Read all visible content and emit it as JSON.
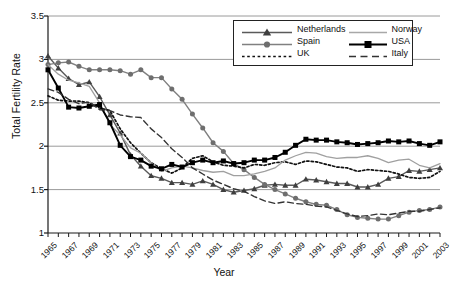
{
  "chart_data": {
    "type": "line",
    "title": "",
    "xlabel": "Year",
    "ylabel": "Total Fertility Rate",
    "ylim": [
      1,
      3.5
    ],
    "yticks": [
      "1",
      "1.5",
      "2",
      "2.5",
      "3",
      "3.5"
    ],
    "ytick_values": [
      1,
      1.5,
      2,
      2.5,
      3,
      3.5
    ],
    "grid": "horizontal",
    "legend_position": "top-right",
    "xlim": [
      1965,
      2003
    ],
    "x": [
      1965,
      1966,
      1967,
      1968,
      1969,
      1970,
      1971,
      1972,
      1973,
      1974,
      1975,
      1976,
      1977,
      1978,
      1979,
      1980,
      1981,
      1982,
      1983,
      1984,
      1985,
      1986,
      1987,
      1988,
      1989,
      1990,
      1991,
      1992,
      1993,
      1994,
      1995,
      1996,
      1997,
      1998,
      1999,
      2000,
      2001,
      2002,
      2003
    ],
    "xtick_labels": [
      "1965",
      "1967",
      "1969",
      "1971",
      "1973",
      "1975",
      "1977",
      "1979",
      "1981",
      "1983",
      "1985",
      "1987",
      "1989",
      "1991",
      "1993",
      "1995",
      "1997",
      "1999",
      "2001",
      "2003"
    ],
    "series": [
      {
        "name": "Netherlands",
        "marker": "triangle",
        "line": "solid",
        "color": "#5a5a5a",
        "values": [
          3.04,
          2.9,
          2.78,
          2.71,
          2.74,
          2.57,
          2.36,
          2.15,
          1.9,
          1.77,
          1.66,
          1.63,
          1.58,
          1.58,
          1.56,
          1.6,
          1.56,
          1.5,
          1.47,
          1.49,
          1.51,
          1.55,
          1.56,
          1.55,
          1.55,
          1.62,
          1.61,
          1.59,
          1.57,
          1.57,
          1.53,
          1.53,
          1.56,
          1.63,
          1.65,
          1.72,
          1.71,
          1.73,
          1.75
        ]
      },
      {
        "name": "Spain",
        "marker": "circle",
        "line": "solid",
        "color": "#808080",
        "values": [
          2.94,
          2.96,
          2.97,
          2.92,
          2.88,
          2.88,
          2.88,
          2.87,
          2.83,
          2.88,
          2.79,
          2.79,
          2.66,
          2.54,
          2.37,
          2.21,
          2.04,
          1.94,
          1.8,
          1.73,
          1.64,
          1.56,
          1.5,
          1.45,
          1.4,
          1.36,
          1.33,
          1.32,
          1.27,
          1.21,
          1.18,
          1.17,
          1.16,
          1.16,
          1.2,
          1.24,
          1.26,
          1.27,
          1.3
        ]
      },
      {
        "name": "UK",
        "marker": "none",
        "line": "dotted",
        "color": "#111111",
        "values": [
          2.58,
          2.53,
          2.52,
          2.52,
          2.5,
          2.44,
          2.41,
          2.2,
          2.04,
          1.92,
          1.81,
          1.74,
          1.69,
          1.75,
          1.86,
          1.89,
          1.82,
          1.78,
          1.77,
          1.75,
          1.79,
          1.78,
          1.81,
          1.82,
          1.79,
          1.83,
          1.82,
          1.79,
          1.76,
          1.75,
          1.71,
          1.73,
          1.72,
          1.71,
          1.68,
          1.64,
          1.63,
          1.64,
          1.71
        ]
      },
      {
        "name": "Norway",
        "marker": "none",
        "line": "solid-thin",
        "color": "#a0a0a0",
        "values": [
          2.94,
          2.83,
          2.76,
          2.73,
          2.69,
          2.5,
          2.25,
          2.13,
          1.98,
          1.92,
          1.81,
          1.71,
          1.75,
          1.77,
          1.75,
          1.72,
          1.7,
          1.71,
          1.66,
          1.66,
          1.68,
          1.71,
          1.75,
          1.84,
          1.89,
          1.93,
          1.92,
          1.88,
          1.86,
          1.87,
          1.87,
          1.89,
          1.86,
          1.81,
          1.84,
          1.85,
          1.78,
          1.75,
          1.8
        ]
      },
      {
        "name": "USA",
        "marker": "square",
        "line": "solid-bold",
        "color": "#000000",
        "values": [
          2.88,
          2.67,
          2.45,
          2.44,
          2.46,
          2.48,
          2.27,
          2.01,
          1.88,
          1.84,
          1.77,
          1.74,
          1.79,
          1.76,
          1.81,
          1.84,
          1.81,
          1.83,
          1.8,
          1.81,
          1.84,
          1.84,
          1.87,
          1.93,
          2.01,
          2.08,
          2.07,
          2.07,
          2.05,
          2.04,
          2.02,
          2.03,
          2.04,
          2.06,
          2.05,
          2.06,
          2.03,
          2.01,
          2.05
        ]
      },
      {
        "name": "Italy",
        "marker": "none",
        "line": "dashed",
        "color": "#333333",
        "values": [
          2.66,
          2.62,
          2.54,
          2.49,
          2.51,
          2.42,
          2.41,
          2.36,
          2.34,
          2.33,
          2.2,
          2.1,
          1.97,
          1.87,
          1.75,
          1.68,
          1.61,
          1.56,
          1.51,
          1.48,
          1.42,
          1.37,
          1.34,
          1.36,
          1.34,
          1.33,
          1.31,
          1.3,
          1.26,
          1.22,
          1.19,
          1.2,
          1.22,
          1.21,
          1.23,
          1.25,
          1.25,
          1.27,
          1.29
        ]
      }
    ]
  },
  "legend": {
    "entries": [
      {
        "label": "Netherlands"
      },
      {
        "label": "Norway"
      },
      {
        "label": "Spain"
      },
      {
        "label": "USA"
      },
      {
        "label": "UK"
      },
      {
        "label": "Italy"
      }
    ]
  },
  "colors": {
    "axis": "#1a1a1a",
    "grid": "#9a9a9a",
    "background": "#ffffff"
  }
}
